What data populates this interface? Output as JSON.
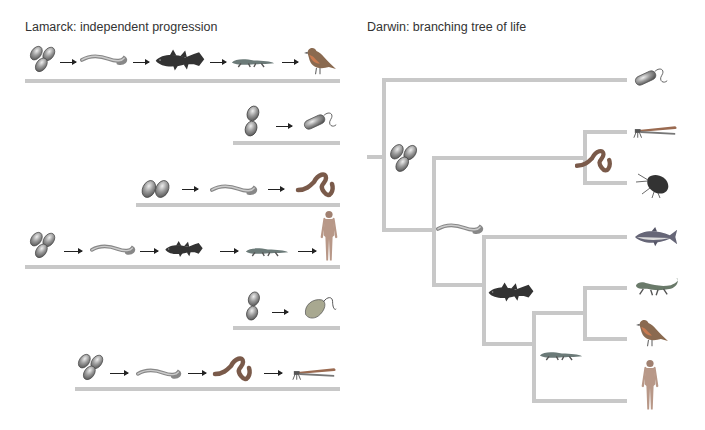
{
  "lamarck": {
    "title": "Lamarck: independent progression",
    "rows": [
      {
        "sequence": [
          "cells",
          "worm",
          "coelacanth",
          "amphibian",
          "bird"
        ]
      },
      {
        "sequence": [
          "cells",
          "bacterium"
        ]
      },
      {
        "sequence": [
          "cells",
          "worm",
          "earthworm"
        ]
      },
      {
        "sequence": [
          "cells",
          "worm",
          "coelacanth",
          "amphibian",
          "human"
        ]
      },
      {
        "sequence": [
          "cells",
          "protist"
        ]
      },
      {
        "sequence": [
          "cells",
          "worm",
          "earthworm",
          "dragonfly"
        ]
      }
    ]
  },
  "darwin": {
    "title": "Darwin: branching tree of life",
    "leaves": [
      "bacterium",
      "dragonfly",
      "water flea",
      "tuna",
      "lizard",
      "bird",
      "human"
    ],
    "ancestors": [
      "cells",
      "earthworm",
      "worm",
      "coelacanth",
      "amphibian"
    ]
  },
  "colors": {
    "branch": "#c8c8c8",
    "text": "#333333"
  }
}
